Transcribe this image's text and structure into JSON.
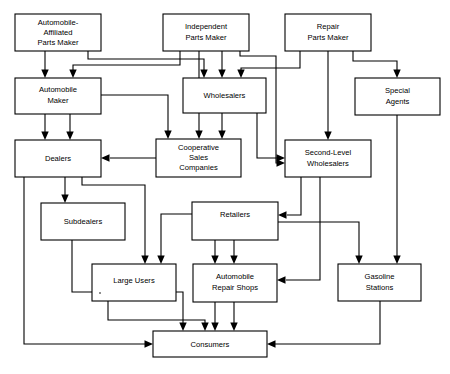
{
  "diagram": {
    "type": "flowchart",
    "nodes": [
      {
        "id": "automobile-affiliated-parts-maker",
        "lines": [
          "Automobile-",
          "Affiliated",
          "Parts Maker"
        ],
        "x": 15,
        "y": 14,
        "w": 86,
        "h": 37
      },
      {
        "id": "independent-parts-maker",
        "lines": [
          "Independent",
          "Parts Maker"
        ],
        "x": 163,
        "y": 14,
        "w": 86,
        "h": 37
      },
      {
        "id": "repair-parts-maker",
        "lines": [
          "Repair",
          "Parts Maker"
        ],
        "x": 285,
        "y": 14,
        "w": 86,
        "h": 37
      },
      {
        "id": "automobile-maker",
        "lines": [
          "Automobile",
          "Maker"
        ],
        "x": 15,
        "y": 78,
        "w": 86,
        "h": 36
      },
      {
        "id": "wholesalers",
        "lines": [
          "Wholesalers"
        ],
        "x": 183,
        "y": 78,
        "w": 83,
        "h": 35
      },
      {
        "id": "special-agents",
        "lines": [
          "Special",
          "Agents"
        ],
        "x": 355,
        "y": 78,
        "w": 85,
        "h": 37
      },
      {
        "id": "dealers",
        "lines": [
          "Dealers"
        ],
        "x": 15,
        "y": 140,
        "w": 86,
        "h": 37
      },
      {
        "id": "cooperative-sales-companies",
        "lines": [
          "Cooperative",
          "Sales",
          "Companies"
        ],
        "x": 156,
        "y": 139,
        "w": 85,
        "h": 38
      },
      {
        "id": "second-level-wholesalers",
        "lines": [
          "Second-Level",
          "Wholesalers"
        ],
        "x": 285,
        "y": 140,
        "w": 86,
        "h": 37
      },
      {
        "id": "subdealers",
        "lines": [
          "Subdealers"
        ],
        "x": 41,
        "y": 203,
        "w": 84,
        "h": 37
      },
      {
        "id": "retailers",
        "lines": [
          "Retailers"
        ],
        "x": 192,
        "y": 202,
        "w": 86,
        "h": 38
      },
      {
        "id": "large-users",
        "lines": [
          "Large Users"
        ],
        "x": 92,
        "y": 264,
        "w": 84,
        "h": 37
      },
      {
        "id": "automobile-repair-shops",
        "lines": [
          "Automobile",
          "Repair Shops"
        ],
        "x": 193,
        "y": 264,
        "w": 84,
        "h": 38
      },
      {
        "id": "gasoline-stations",
        "lines": [
          "Gasoline",
          "Stations"
        ],
        "x": 338,
        "y": 264,
        "w": 83,
        "h": 37
      },
      {
        "id": "consumers",
        "lines": [
          "Consumers"
        ],
        "x": 153,
        "y": 331,
        "w": 114,
        "h": 26
      }
    ],
    "connections": [
      {
        "from": "automobile-affiliated-parts-maker",
        "to": "automobile-maker",
        "path": "M 45,51 L 45,72"
      },
      {
        "from": "automobile-affiliated-parts-maker",
        "to": "wholesalers",
        "path": "M 88,51 L 88,59 L 202,59 L 202,72"
      },
      {
        "from": "independent-parts-maker",
        "to": "automobile-maker",
        "path": "M 180,51 L 180,64 L 73,64 L 73,72"
      },
      {
        "from": "independent-parts-maker",
        "to": "wholesalers",
        "path": "M 220,51 L 220,72"
      },
      {
        "from": "independent-parts-maker",
        "to": "cooperative-sales-companies",
        "path": "M 199,51 L 199,133"
      },
      {
        "from": "independent-parts-maker",
        "to": "second-level-wholesalers-route",
        "path": "M 240,51 L 240,56 L 276,56 L 276,164 L 278,164"
      },
      {
        "from": "repair-parts-maker",
        "to": "wholesalers",
        "path": "M 300,51 L 300,68 L 239,68 L 239,72"
      },
      {
        "from": "repair-parts-maker",
        "to": "second-level-wholesalers",
        "path": "M 328,51 L 328,134"
      },
      {
        "from": "repair-parts-maker",
        "to": "special-agents",
        "path": "M 355,51 L 355,62 L 397,62 L 397,72"
      },
      {
        "from": "automobile-maker",
        "to": "dealers-a",
        "path": "M 45,114 L 45,134"
      },
      {
        "from": "automobile-maker",
        "to": "dealers-b",
        "path": "M 70,114 L 70,134"
      },
      {
        "from": "automobile-maker",
        "to": "cooperative-sales-companies",
        "path": "M 101,95 L 167,95 L 167,133"
      },
      {
        "from": "wholesalers",
        "to": "cooperative-sales-companies",
        "path": "M 220,113 L 220,133"
      },
      {
        "from": "wholesalers",
        "to": "second-level-wholesalers",
        "path": "M 257,113 L 257,158 L 278,158"
      },
      {
        "from": "special-agents",
        "to": "gasoline-stations",
        "path": "M 397,115 L 397,258"
      },
      {
        "from": "cooperative-sales-companies",
        "to": "dealers",
        "path": "M 156,158 L 108,158"
      },
      {
        "from": "dealers",
        "to": "subdealers",
        "path": "M 65,177 L 65,197"
      },
      {
        "from": "dealers",
        "to": "large-users",
        "path": "M 82,177 L 82,184 L 145,184 L 145,258"
      },
      {
        "from": "dealers",
        "to": "consumers",
        "path": "M 24,177 L 24,344 L 147,344"
      },
      {
        "from": "second-level-wholesalers",
        "to": "retailers",
        "path": "M 300,177 L 300,216 L 285,216"
      },
      {
        "from": "second-level-wholesalers",
        "to": "automobile-repair-shops",
        "path": "M 319,177 L 319,280 L 283,280"
      },
      {
        "from": "retailers",
        "to": "large-users",
        "path": "M 192,214 L 160,214 L 160,258"
      },
      {
        "from": "retailers",
        "to": "automobile-repair-shops-a",
        "path": "M 215,240 L 215,258"
      },
      {
        "from": "retailers",
        "to": "automobile-repair-shops-b",
        "path": "M 234,240 L 234,258"
      },
      {
        "from": "retailers",
        "to": "gasoline-stations",
        "path": "M 278,222 L 359,222 L 359,258"
      },
      {
        "from": "subdealers",
        "to": "consumers",
        "path": "M 72,240 L 72,292 L 183,292 L 183,325"
      },
      {
        "from": "large-users",
        "to": "consumers",
        "path": "M 108,301 L 108,322 L 242,322 L 242,325"
      },
      {
        "from": "automobile-repair-shops-a",
        "to": "consumers",
        "path": "M 215,302 L 215,325"
      },
      {
        "from": "automobile-repair-shops-b",
        "to": "consumers",
        "path": "M 234,302 L 234,325"
      },
      {
        "from": "gasoline-stations",
        "to": "consumers",
        "path": "M 380,301 L 380,344 L 273,344"
      }
    ]
  }
}
